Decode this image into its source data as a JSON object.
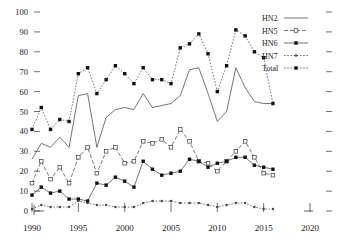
{
  "chart_data": {
    "type": "line",
    "title": "",
    "subtitle": "",
    "xlabel": "",
    "ylabel": "",
    "xlim": [
      1990,
      2020
    ],
    "ylim": [
      0,
      100
    ],
    "grid": false,
    "legend_position": "top-right",
    "x": [
      1990,
      1991,
      1992,
      1993,
      1994,
      1995,
      1996,
      1997,
      1998,
      1999,
      2000,
      2001,
      2002,
      2003,
      2004,
      2005,
      2006,
      2007,
      2008,
      2009,
      2010,
      2011,
      2012,
      2013,
      2014,
      2015,
      2016
    ],
    "xticks": [
      1990,
      1995,
      2000,
      2005,
      2010,
      2015,
      2020
    ],
    "xticklabels": [
      "1990",
      "1995",
      "2000",
      "2005",
      "2010",
      "2015",
      "2020"
    ],
    "yticks": [
      0,
      10,
      20,
      30,
      40,
      50,
      60,
      70,
      80,
      90,
      100
    ],
    "yticklabels": [
      "0",
      "10",
      "20",
      "30",
      "40",
      "50",
      "60",
      "70",
      "80",
      "90",
      "100"
    ],
    "series": [
      {
        "name": "HN2",
        "style": "solid",
        "marker": "none",
        "values": [
          26,
          34,
          32,
          37,
          32,
          58,
          59,
          32,
          47,
          51,
          52,
          51,
          59,
          52,
          53,
          54,
          58,
          71,
          72,
          59,
          45,
          50,
          72,
          62,
          55,
          54,
          54
        ]
      },
      {
        "name": "HN5",
        "style": "dashed",
        "marker": "open-square",
        "values": [
          14,
          25,
          16,
          22,
          14,
          27,
          32,
          19,
          30,
          32,
          24,
          25,
          35,
          34,
          36,
          32,
          41,
          35,
          25,
          24,
          20,
          25,
          30,
          35,
          27,
          19,
          18
        ]
      },
      {
        "name": "HN6",
        "style": "solid",
        "marker": "filled-square",
        "values": [
          8,
          12,
          9,
          10,
          6,
          6,
          5,
          14,
          13,
          17,
          15,
          12,
          25,
          21,
          18,
          19,
          20,
          26,
          25,
          22,
          24,
          25,
          27,
          27,
          23,
          22,
          21
        ]
      },
      {
        "name": "HN7",
        "style": "dotted",
        "marker": "open-circle",
        "values": [
          1,
          3,
          2,
          2,
          2,
          5,
          4,
          3,
          3,
          2,
          2,
          2,
          4,
          5,
          5,
          5,
          4,
          4,
          4,
          3,
          2,
          3,
          4,
          4,
          2,
          1,
          1
        ]
      },
      {
        "name": "Total",
        "style": "dotted",
        "marker": "filled-square",
        "values": [
          41,
          52,
          41,
          46,
          45,
          69,
          72,
          59,
          66,
          73,
          69,
          64,
          72,
          66,
          66,
          64,
          82,
          84,
          89,
          79,
          60,
          73,
          91,
          88,
          80,
          77,
          54
        ]
      }
    ]
  },
  "legend": {
    "entries": [
      {
        "label": "HN2"
      },
      {
        "label": "HN5"
      },
      {
        "label": "HN6"
      },
      {
        "label": "HN7"
      },
      {
        "label": "Total"
      }
    ]
  }
}
